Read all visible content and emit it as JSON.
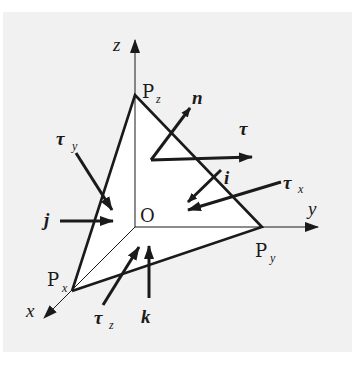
{
  "figure": {
    "colors": {
      "background": "#ffffff",
      "panel": "#f1f1f1",
      "face": "#ffffff",
      "stroke": "#1a1a1a"
    },
    "axes": {
      "x": {
        "label": "x"
      },
      "y": {
        "label": "y"
      },
      "z": {
        "label": "z"
      }
    },
    "points": {
      "origin": {
        "label": "O"
      },
      "px": {
        "label": "P",
        "sub": "x"
      },
      "py": {
        "label": "P",
        "sub": "y"
      },
      "pz": {
        "label": "P",
        "sub": "z"
      }
    },
    "vectors": {
      "n": {
        "label": "n"
      },
      "tau": {
        "label": "τ"
      },
      "i": {
        "label": "i"
      },
      "j": {
        "label": "j"
      },
      "k": {
        "label": "k"
      },
      "tau_x": {
        "label": "τ",
        "sub": "x"
      },
      "tau_y": {
        "label": "τ",
        "sub": "y"
      },
      "tau_z": {
        "label": "τ",
        "sub": "z"
      }
    }
  }
}
